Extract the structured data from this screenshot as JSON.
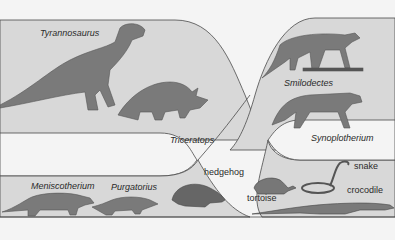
{
  "colors": {
    "background": "#f4f4f4",
    "band": "#d8d8d8",
    "line": "#4a4a4a",
    "animal": "#7a7a7a",
    "animal_dark": "#555555"
  },
  "labels": {
    "tyrannosaurus": "Tyrannosaurus",
    "triceratops": "Triceratops",
    "smilodectes": "Smilodectes",
    "synoplotherium": "Synoplotherium",
    "meniscotherium": "Meniscotherium",
    "purgatorius": "Purgatorius",
    "hedgehog": "hedgehog",
    "tortoise": "tortoise",
    "snake": "snake",
    "crocodile": "crocodile"
  }
}
